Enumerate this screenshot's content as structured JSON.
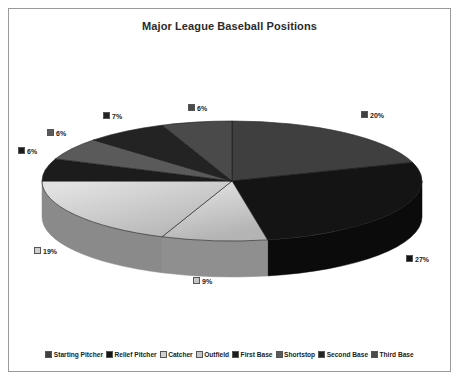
{
  "chart": {
    "title": "Major League Baseball Positions",
    "border_color": "#9a9a9a",
    "background": "#ffffff"
  },
  "chart_data": {
    "type": "pie",
    "title": "Major League Baseball Positions",
    "three_d": true,
    "legend_position": "bottom",
    "categories": [
      "Starting Pitcher",
      "Relief Pitcher",
      "Catcher",
      "Outfield",
      "First Base",
      "Shortstop",
      "Second Base",
      "Third Base"
    ],
    "values": [
      20,
      27,
      9,
      19,
      6,
      6,
      7,
      6
    ],
    "labels": [
      "20%",
      "27%",
      "9%",
      "19%",
      "6%",
      "6%",
      "7%",
      "6%"
    ],
    "colors": [
      "#3f3f3f",
      "#141414",
      "#cfcfcf",
      "#c6c6c6",
      "#1c1c1c",
      "#5a5a5a",
      "#232323",
      "#4a4a4a"
    ],
    "side_colors": [
      "#2b2b2b",
      "#0b0b0b",
      "#8f8f8f",
      "#8a8a8a",
      "#111111",
      "#3c3c3c",
      "#151515",
      "#313131"
    ],
    "total": 100,
    "units": "percent"
  },
  "pie_labels": [
    {
      "text": "20%",
      "color": "#3f3f3f",
      "x": 361,
      "y": 110
    },
    {
      "text": "27%",
      "color": "#141414",
      "x": 406,
      "y": 254
    },
    {
      "text": "9%",
      "color": "#c6c6c6",
      "x": 193,
      "y": 276
    },
    {
      "text": "19%",
      "color": "#cfcfcf",
      "x": 34,
      "y": 246
    },
    {
      "text": "6%",
      "color": "#1c1c1c",
      "x": 18,
      "y": 146
    },
    {
      "text": "6%",
      "color": "#5a5a5a",
      "x": 47,
      "y": 128
    },
    {
      "text": "7%",
      "color": "#232323",
      "x": 103,
      "y": 111
    },
    {
      "text": "6%",
      "color": "#4a4a4a",
      "x": 188,
      "y": 103
    }
  ],
  "legend": {
    "items": [
      {
        "label": "Starting Pitcher",
        "color": "#3f3f3f"
      },
      {
        "label": "Relief Pitcher",
        "color": "#141414"
      },
      {
        "label": "Catcher",
        "color": "#cfcfcf"
      },
      {
        "label": "Outfield",
        "color": "#c6c6c6"
      },
      {
        "label": "First Base",
        "color": "#1c1c1c"
      },
      {
        "label": "Shortstop",
        "color": "#5a5a5a"
      },
      {
        "label": "Second Base",
        "color": "#232323"
      },
      {
        "label": "Third Base",
        "color": "#4a4a4a"
      }
    ]
  },
  "geometry": {
    "cx": 232,
    "cy": 181,
    "rx": 190,
    "ry": 60,
    "depth": 36,
    "start_angle_deg": -90
  }
}
